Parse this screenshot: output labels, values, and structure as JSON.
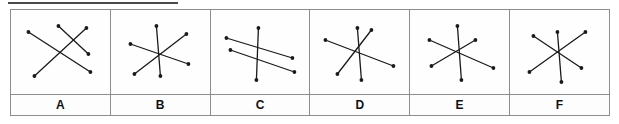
{
  "figure": {
    "option_count": 6,
    "stroke_color": "#1a1a1a",
    "dot_color": "#1a1a1a",
    "border_color": "#8d8d8d",
    "background_color": "#ffffff",
    "top_rule_color": "#4a4a4a"
  },
  "options": [
    {
      "label": "A",
      "description": "three line segments crossing at slightly offset points, not concurrent",
      "segments": [
        {
          "x1": 14,
          "y1": 22,
          "x2": 76,
          "y2": 62
        },
        {
          "x1": 20,
          "y1": 66,
          "x2": 72,
          "y2": 18
        },
        {
          "x1": 44,
          "y1": 16,
          "x2": 74,
          "y2": 44
        }
      ]
    },
    {
      "label": "B",
      "description": "three line segments concurrent at a single centre point forming a six-ray star",
      "segments": [
        {
          "x1": 42,
          "y1": 16,
          "x2": 46,
          "y2": 66
        },
        {
          "x1": 16,
          "y1": 34,
          "x2": 74,
          "y2": 54
        },
        {
          "x1": 20,
          "y1": 64,
          "x2": 72,
          "y2": 24
        }
      ]
    },
    {
      "label": "C",
      "description": "two parallel diagonal segments crossed by one near-vertical segment",
      "segments": [
        {
          "x1": 12,
          "y1": 28,
          "x2": 78,
          "y2": 48
        },
        {
          "x1": 16,
          "y1": 40,
          "x2": 80,
          "y2": 62
        },
        {
          "x1": 44,
          "y1": 18,
          "x2": 42,
          "y2": 70
        }
      ]
    },
    {
      "label": "D",
      "description": "three line segments meeting near a common point with one short upper-right ray",
      "segments": [
        {
          "x1": 12,
          "y1": 30,
          "x2": 80,
          "y2": 56
        },
        {
          "x1": 44,
          "y1": 18,
          "x2": 48,
          "y2": 70
        },
        {
          "x1": 24,
          "y1": 64,
          "x2": 58,
          "y2": 20
        }
      ]
    },
    {
      "label": "E",
      "description": "three line segments concurrent at a centre point with a short left-pointing ray",
      "segments": [
        {
          "x1": 16,
          "y1": 30,
          "x2": 80,
          "y2": 58
        },
        {
          "x1": 44,
          "y1": 16,
          "x2": 48,
          "y2": 70
        },
        {
          "x1": 18,
          "y1": 56,
          "x2": 62,
          "y2": 30
        }
      ]
    },
    {
      "label": "F",
      "description": "three line segments concurrent at a centre point forming a symmetric six-ray star",
      "segments": [
        {
          "x1": 20,
          "y1": 26,
          "x2": 68,
          "y2": 58
        },
        {
          "x1": 44,
          "y1": 22,
          "x2": 48,
          "y2": 72
        },
        {
          "x1": 16,
          "y1": 62,
          "x2": 72,
          "y2": 22
        }
      ]
    }
  ]
}
